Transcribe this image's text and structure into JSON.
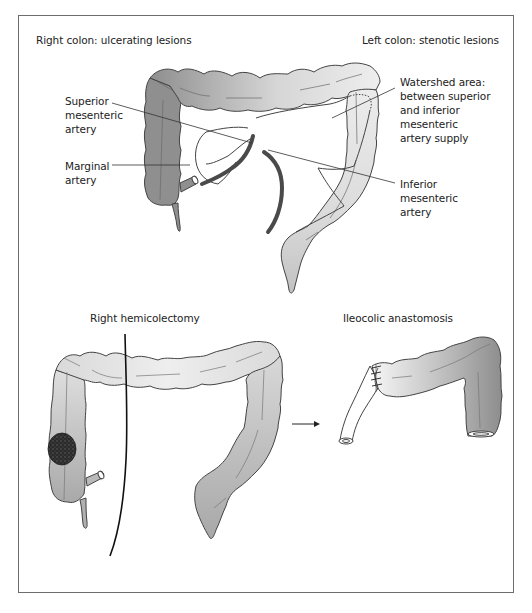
{
  "figure": {
    "top_panel": {
      "heading_left": "Right colon: ulcerating lesions",
      "heading_right": "Left colon: stenotic lesions",
      "labels": {
        "superior_mesenteric_artery": [
          "Superior",
          "mesenteric",
          "artery"
        ],
        "marginal_artery": [
          "Marginal",
          "artery"
        ],
        "watershed_area": [
          "Watershed area:",
          "between superior",
          "and inferior",
          "mesenteric",
          "artery supply"
        ],
        "inferior_mesenteric_artery": [
          "Inferior",
          "mesenteric",
          "artery"
        ]
      }
    },
    "bottom_panel": {
      "left_heading": "Right hemicolectomy",
      "right_heading": "Ileocolic anastomosis",
      "arrow": "right-arrow"
    },
    "colors": {
      "frame_border": "#6d6d6d",
      "colon_dark": "#8f8f8f",
      "colon_light": "#ececec",
      "artery": "#4a4a4a",
      "tumor": "#2e2e2e",
      "outline": "#444444"
    }
  }
}
